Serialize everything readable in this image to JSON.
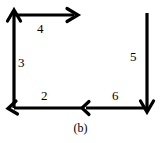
{
  "figure": {
    "caption": "(b)",
    "background_color": "#ffffff",
    "stroke_color": "#000000",
    "stroke_width": 3,
    "width": 161,
    "height": 143,
    "edges": [
      {
        "id": "edge-4",
        "label": "4",
        "name": "top-edge",
        "orientation": "horizontal",
        "direction": "right",
        "from": [
          14,
          15
        ],
        "to": [
          78,
          15
        ],
        "arrow_at": "end",
        "label_position": [
          37,
          22
        ]
      },
      {
        "id": "edge-3",
        "label": "3",
        "name": "left-edge",
        "orientation": "vertical",
        "direction": "up",
        "from": [
          14,
          108
        ],
        "to": [
          14,
          10
        ],
        "arrow_at": "end",
        "label_position": [
          18,
          56
        ]
      },
      {
        "id": "edge-2",
        "label": "2",
        "name": "bottom-left-edge",
        "orientation": "horizontal",
        "direction": "left",
        "from": [
          82,
          108
        ],
        "to": [
          8,
          108
        ],
        "arrow_at": "end",
        "label_position": [
          41,
          89
        ]
      },
      {
        "id": "edge-6",
        "label": "6",
        "name": "bottom-right-edge",
        "orientation": "horizontal",
        "direction": "left",
        "from": [
          147,
          108
        ],
        "to": [
          82,
          108
        ],
        "arrow_at": "end",
        "label_position": [
          112,
          89
        ]
      },
      {
        "id": "edge-5",
        "label": "5",
        "name": "right-edge",
        "orientation": "vertical",
        "direction": "down",
        "from": [
          147,
          13
        ],
        "to": [
          147,
          112
        ],
        "arrow_at": "end",
        "label_position": [
          130,
          50
        ]
      }
    ]
  }
}
